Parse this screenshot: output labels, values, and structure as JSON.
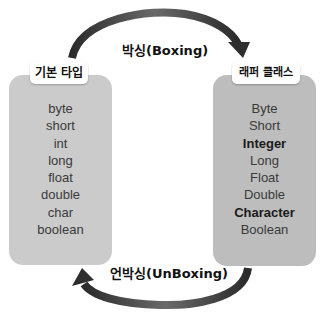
{
  "diagram": {
    "top_arrow": {
      "label": "박싱(Boxing)",
      "direction": "primitive-to-wrapper"
    },
    "bottom_arrow": {
      "label": "언박싱(UnBoxing)",
      "direction": "wrapper-to-primitive"
    },
    "colors": {
      "primitive_box": "#cbcbcb",
      "wrapper_box": "#bdbdbd",
      "arrow": "#3a3a3a",
      "label_bg": "#ffffff"
    },
    "primitive": {
      "title": "기본 타입",
      "items": [
        "byte",
        "short",
        "int",
        "long",
        "float",
        "double",
        "char",
        "boolean"
      ]
    },
    "wrapper": {
      "title": "래퍼 클래스",
      "items": [
        "Byte",
        "Short",
        "Integer",
        "Long",
        "Float",
        "Double",
        "Character",
        "Boolean"
      ],
      "bold_items": [
        "Integer",
        "Character"
      ]
    }
  }
}
